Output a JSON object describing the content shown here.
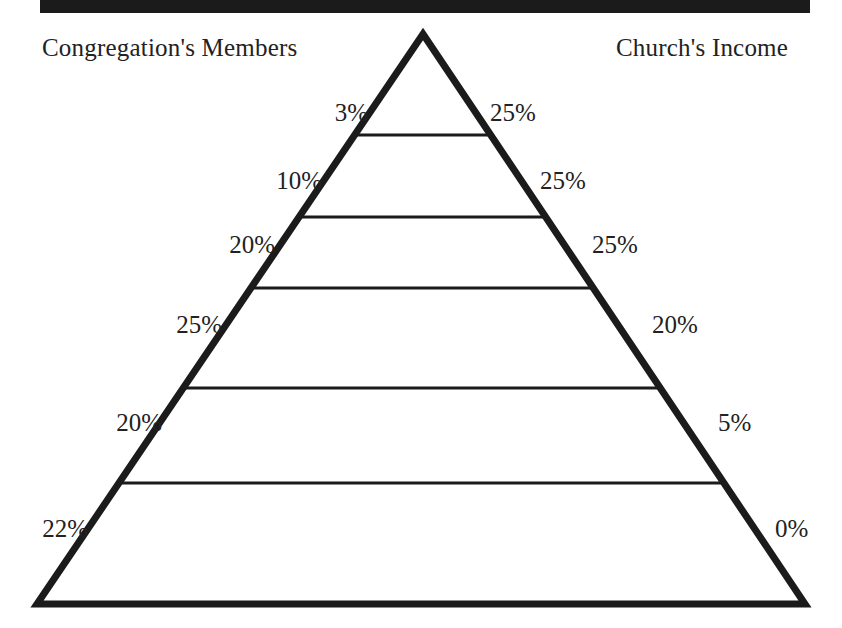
{
  "figure": {
    "title_left": "Congregation's Members",
    "title_right": "Church's Income",
    "ink_color": "#1b1b1b",
    "background_color": "#ffffff"
  },
  "chart_data": {
    "type": "pie",
    "title": "",
    "subtitle": "",
    "xlabel": "",
    "ylabel": "",
    "legend_position": "top",
    "grid": false,
    "shape": "pyramid",
    "tier_count": 6,
    "series": [
      {
        "name": "Congregation's Members",
        "side": "left",
        "values": [
          3,
          10,
          20,
          25,
          20,
          22
        ],
        "labels": [
          "3%",
          "10%",
          "20%",
          "25%",
          "20%",
          "22%"
        ]
      },
      {
        "name": "Church's Income",
        "side": "right",
        "values": [
          25,
          25,
          25,
          20,
          5,
          0
        ],
        "labels": [
          "25%",
          "25%",
          "25%",
          "20%",
          "5%",
          "0%"
        ]
      }
    ],
    "categories": [
      "tier-1-apex",
      "tier-2",
      "tier-3",
      "tier-4",
      "tier-5",
      "tier-6-base"
    ],
    "annotations": [
      "Left column totals 100%",
      "Right column totals 100%"
    ]
  },
  "left_labels": [
    {
      "text": "3%",
      "x": 368,
      "y": 100
    },
    {
      "text": "10%",
      "x": 322,
      "y": 168
    },
    {
      "text": "20%",
      "x": 275,
      "y": 232
    },
    {
      "text": "25%",
      "x": 222,
      "y": 312
    },
    {
      "text": "20%",
      "x": 162,
      "y": 410
    },
    {
      "text": "22%",
      "x": 88,
      "y": 516
    }
  ],
  "right_labels": [
    {
      "text": "25%",
      "x": 490,
      "y": 100
    },
    {
      "text": "25%",
      "x": 540,
      "y": 168
    },
    {
      "text": "25%",
      "x": 592,
      "y": 232
    },
    {
      "text": "20%",
      "x": 652,
      "y": 312
    },
    {
      "text": "5%",
      "x": 718,
      "y": 410
    },
    {
      "text": "0%",
      "x": 775,
      "y": 516
    }
  ],
  "geometry": {
    "apex_x": 423,
    "apex_y": 34,
    "base_left_x": 37,
    "base_right_x": 805,
    "base_y": 604,
    "divider_y": [
      135,
      217,
      288,
      388,
      483
    ],
    "outline_stroke_width": 7,
    "divider_stroke_width": 3
  }
}
